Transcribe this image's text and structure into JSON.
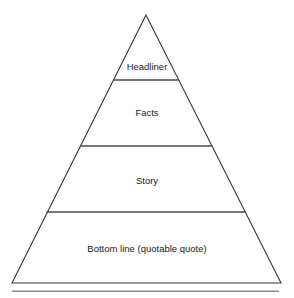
{
  "diagram": {
    "type": "pyramid",
    "title": "",
    "tiers": [
      {
        "label": "Headliner",
        "level": 1
      },
      {
        "label": "Facts",
        "level": 2
      },
      {
        "label": "Story",
        "level": 3
      },
      {
        "label": "Bottom line (quotable quote)",
        "level": 4
      }
    ],
    "colors": {
      "outline": "#3a3a3a",
      "divider": "#4a4a4a",
      "text": "#1b1b1b",
      "background": "#ffffff",
      "rule": "#8c8c8c"
    },
    "geometry": {
      "apex_x": 146,
      "apex_y": 15,
      "base_left_x": 12,
      "base_right_x": 281,
      "base_y": 283,
      "divider_y": [
        80,
        146,
        212
      ]
    },
    "footer_rule": {
      "x1": 12,
      "x2": 279,
      "y": 291
    }
  }
}
